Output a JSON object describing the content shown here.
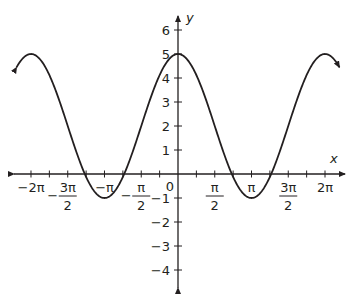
{
  "chart_data": {
    "type": "line",
    "title": "",
    "function": "y = 2 + 3cos(x)",
    "xlabel": "x",
    "ylabel": "y",
    "xlim": [
      -6.9,
      6.9
    ],
    "ylim": [
      -4.5,
      6.5
    ],
    "grid": false,
    "legend": null,
    "x_ticks": [
      {
        "value": -6.2832,
        "label": "−2π"
      },
      {
        "value": -4.7124,
        "label_num": "3π",
        "label_den": "2",
        "sign": "−"
      },
      {
        "value": -3.1416,
        "label": "−π"
      },
      {
        "value": -1.5708,
        "label_num": "π",
        "label_den": "2",
        "sign": "−"
      },
      {
        "value": 0,
        "label": "0"
      },
      {
        "value": 1.5708,
        "label_num": "π",
        "label_den": "2",
        "sign": ""
      },
      {
        "value": 3.1416,
        "label": "π"
      },
      {
        "value": 4.7124,
        "label_num": "3π",
        "label_den": "2",
        "sign": ""
      },
      {
        "value": 6.2832,
        "label": "2π"
      }
    ],
    "x_minor_tick_step": 0.7854,
    "y_ticks": [
      -4,
      -3,
      -2,
      -1,
      1,
      2,
      3,
      4,
      5,
      6
    ],
    "y_tick_labels": [
      "−4",
      "−3",
      "−2",
      "−1",
      "1",
      "2",
      "3",
      "4",
      "5",
      "6"
    ],
    "key_points": [
      {
        "x": -6.2832,
        "y": 5
      },
      {
        "x": -3.1416,
        "y": -1
      },
      {
        "x": 0,
        "y": 5
      },
      {
        "x": 3.1416,
        "y": -1
      },
      {
        "x": 6.2832,
        "y": 5
      }
    ],
    "curve_domain": [
      -6.9,
      6.9
    ],
    "curve_arrows": "both ends",
    "colors": {
      "curve": "#231f20",
      "axes": "#231f20",
      "background": "#ffffff"
    }
  }
}
